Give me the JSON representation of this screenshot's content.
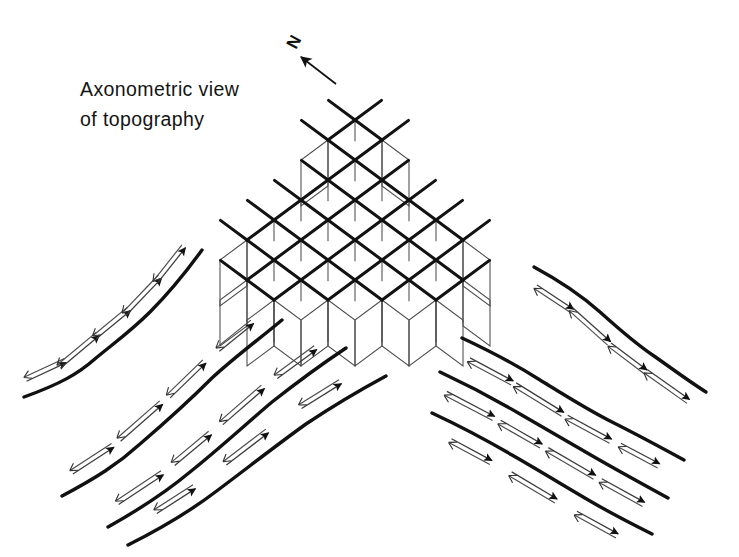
{
  "figure": {
    "title_line_1": "Axonometric view",
    "title_line_2": "of topography",
    "north_label": "N",
    "background_color": "#ffffff",
    "ink_color": "#111111",
    "thin_line_color": "#5a5a5a"
  },
  "chart_data": {
    "type": "diagram",
    "title": "Axonometric view of topography",
    "subtitle": "",
    "xlabel": "",
    "ylabel": "",
    "annotations": [
      {
        "text": "Axonometric view",
        "x": 80,
        "y": 96
      },
      {
        "text": "of topography",
        "x": 80,
        "y": 126
      },
      {
        "text": "N",
        "x": 296,
        "y": 48
      }
    ],
    "legend": [],
    "grid": false,
    "elements": [
      {
        "name": "north-arrow",
        "kind": "arrow",
        "from": [
          335,
          83
        ],
        "to": [
          300,
          56
        ],
        "head": "open",
        "weight": "thin"
      },
      {
        "name": "axonometric-lattice",
        "kind": "mesh",
        "description": "Diamond grid of crossing thick diagonal lines with thin vertical drop-lines and thin parallelogram side panels, forming a stepped terrain block model",
        "center": [
          355,
          200
        ],
        "cell_width": 54,
        "cell_height": 40,
        "skirt_depth": 46,
        "columns": 7,
        "rows": 7,
        "bounds": [
          196,
          44,
          516,
          366
        ]
      },
      {
        "name": "contour-field-left",
        "kind": "contour-group",
        "direction": "up-right",
        "line_count": 4,
        "arrow_style": "double-headed: filled head up-slope, open barb down-slope",
        "bounds": [
          20,
          225,
          300,
          545
        ]
      },
      {
        "name": "contour-field-right",
        "kind": "contour-group",
        "direction": "down-right",
        "line_count": 4,
        "arrow_style": "double-headed: filled head down-slope, open barb up-slope",
        "bounds": [
          430,
          260,
          715,
          525
        ]
      }
    ],
    "contours_left": [
      {
        "id": "L1",
        "path": "M 24,397 C 60,384 78,374 96,358 C 118,340 132,330 150,312 C 170,292 186,272 202,250",
        "arrows": 5
      },
      {
        "id": "L2",
        "path": "M 62,496 C 96,478 118,464 140,444 C 168,420 190,400 212,378 C 236,356 258,340 282,320",
        "arrows": 4
      },
      {
        "id": "L3",
        "path": "M 108,527 C 142,508 166,492 190,472 C 220,448 246,424 272,402 C 300,380 322,364 346,348",
        "arrows": 4
      },
      {
        "id": "L4",
        "path": "M 128,545 C 166,526 192,510 218,490 C 250,466 278,444 306,424 C 336,404 360,390 386,376",
        "arrows": 3
      }
    ],
    "contours_right": [
      {
        "id": "R1",
        "path": "M 534,267 C 560,281 582,296 600,312 C 620,330 636,344 654,356 C 674,370 690,382 706,392",
        "arrows": 4
      },
      {
        "id": "R2",
        "path": "M 462,338 C 492,352 518,366 540,380 C 566,396 588,410 612,422 C 640,436 662,448 684,460",
        "arrows": 4
      },
      {
        "id": "R3",
        "path": "M 440,372 C 470,386 496,400 520,414 C 548,430 572,444 596,458 C 624,474 646,486 668,498",
        "arrows": 4
      },
      {
        "id": "R4",
        "path": "M 432,413 C 462,427 488,441 512,455 C 540,471 566,487 590,501 C 614,515 634,525 652,534",
        "arrows": 3
      }
    ]
  }
}
